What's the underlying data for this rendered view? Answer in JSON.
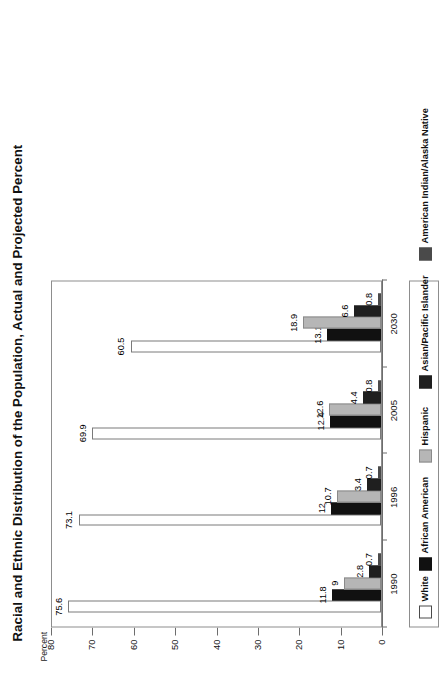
{
  "chart_data": {
    "type": "bar",
    "title": "Racial and Ethnic Distribution of the Population, Actual and Projected Percent",
    "xlabel": "",
    "ylabel": "Percent",
    "ylim": [
      0,
      80
    ],
    "yticks": [
      0,
      10,
      20,
      30,
      40,
      50,
      60,
      70,
      80
    ],
    "ytick_labels": [
      "0",
      "10",
      "20",
      "30",
      "40",
      "50",
      "60",
      "70",
      "80"
    ],
    "grid": false,
    "orientation": "vertical-grouped",
    "page_rotation_deg": -90,
    "legend_position": "bottom",
    "categories": [
      "1990",
      "1996",
      "2005",
      "2030"
    ],
    "series": [
      {
        "name": "White",
        "swatch": "sw-white",
        "color": "#ffffff",
        "values": [
          75.6,
          73.1,
          69.9,
          60.5
        ],
        "labels": [
          "75.6",
          "73.1",
          "69.9",
          "60.5"
        ]
      },
      {
        "name": "African American",
        "swatch": "sw-black",
        "color": "#111111",
        "values": [
          11.8,
          12,
          12.4,
          13.1
        ],
        "labels": [
          "11.8",
          "12",
          "12.4",
          "13.1"
        ]
      },
      {
        "name": "Hispanic",
        "swatch": "sw-lightgray",
        "color": "#b6b6b6",
        "values": [
          9,
          10.7,
          12.6,
          18.9
        ],
        "labels": [
          "9",
          "10.7",
          "12.6",
          "18.9"
        ]
      },
      {
        "name": "Asian/Pacific Islander",
        "swatch": "sw-darkest",
        "color": "#1f1f1f",
        "values": [
          2.8,
          3.4,
          4.4,
          6.6
        ],
        "labels": [
          "2.8",
          "3.4",
          "4.4",
          "6.6"
        ]
      },
      {
        "name": "American Indian/Alaska Native",
        "swatch": "sw-darkgray",
        "color": "#4a4a4a",
        "values": [
          0.7,
          0.7,
          0.8,
          0.8
        ],
        "labels": [
          "0.7",
          "0.7",
          "0.8",
          "0.8"
        ]
      }
    ]
  }
}
